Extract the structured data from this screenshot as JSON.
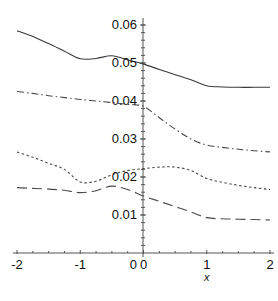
{
  "chart_data": {
    "type": "line",
    "title": "",
    "subtitle": "",
    "xlabel": "x",
    "ylabel": "",
    "xlim": [
      -2,
      2
    ],
    "ylim": [
      0,
      0.064
    ],
    "grid": false,
    "legend": "none",
    "x_ticks": [
      {
        "value": -2,
        "label": "-2"
      },
      {
        "value": -1,
        "label": "-1"
      },
      {
        "value": 0,
        "label": "0"
      },
      {
        "value": 1,
        "label": "1"
      },
      {
        "value": 2,
        "label": "2"
      }
    ],
    "x_minor_ticks": [
      -1.75,
      -1.5,
      -1.25,
      -0.75,
      -0.5,
      -0.25,
      0.25,
      0.5,
      0.75,
      1.25,
      1.5,
      1.75
    ],
    "y_ticks": [
      {
        "value": 0,
        "label": "0"
      },
      {
        "value": 0.01,
        "label": "0.01"
      },
      {
        "value": 0.02,
        "label": "0.02"
      },
      {
        "value": 0.03,
        "label": "0.03"
      },
      {
        "value": 0.04,
        "label": "0.04"
      },
      {
        "value": 0.05,
        "label": "0.05"
      },
      {
        "value": 0.06,
        "label": "0.06"
      }
    ],
    "axis_color": "#555555",
    "series": [
      {
        "name": "solid",
        "style": "solid",
        "color": "#3a3a3a",
        "dasharray": "",
        "x": [
          -2.0,
          -1.75,
          -1.5,
          -1.25,
          -1.0,
          -0.75,
          -0.5,
          -0.25,
          0.0,
          0.25,
          0.5,
          0.75,
          1.0,
          1.25,
          1.5,
          1.75,
          2.0
        ],
        "y": [
          0.0585,
          0.057,
          0.0551,
          0.0531,
          0.0511,
          0.0512,
          0.0519,
          0.0508,
          0.0497,
          0.0483,
          0.0469,
          0.0456,
          0.044,
          0.0437,
          0.0436,
          0.0436,
          0.0436
        ]
      },
      {
        "name": "dash-dot",
        "style": "dashdot",
        "color": "#4a4a4a",
        "dasharray": "7,3,1.5,3",
        "x": [
          -2.0,
          -1.75,
          -1.5,
          -1.25,
          -1.0,
          -0.75,
          -0.5,
          -0.25,
          0.0,
          0.25,
          0.5,
          0.75,
          1.0,
          1.25,
          1.5,
          1.75,
          2.0
        ],
        "y": [
          0.0425,
          0.042,
          0.0414,
          0.0409,
          0.0404,
          0.04,
          0.0396,
          0.0391,
          0.0386,
          0.0356,
          0.0326,
          0.03,
          0.0284,
          0.0278,
          0.0273,
          0.0269,
          0.0266
        ]
      },
      {
        "name": "dotted",
        "style": "dotted",
        "color": "#4a4a4a",
        "dasharray": "2.5,2.5",
        "x": [
          -2.0,
          -1.75,
          -1.5,
          -1.25,
          -1.0,
          -0.75,
          -0.5,
          -0.25,
          0.0,
          0.25,
          0.5,
          0.75,
          1.0,
          1.25,
          1.5,
          1.75,
          2.0
        ],
        "y": [
          0.0266,
          0.0252,
          0.0236,
          0.022,
          0.0187,
          0.0189,
          0.0206,
          0.0217,
          0.0222,
          0.0226,
          0.0226,
          0.0217,
          0.0196,
          0.0186,
          0.0178,
          0.0172,
          0.0167
        ]
      },
      {
        "name": "long-dash",
        "style": "longdash",
        "color": "#4a4a4a",
        "dasharray": "10,5",
        "x": [
          -2.0,
          -1.75,
          -1.5,
          -1.25,
          -1.0,
          -0.75,
          -0.5,
          -0.25,
          0.0,
          0.25,
          0.5,
          0.75,
          1.0,
          1.25,
          1.5,
          1.75,
          2.0
        ],
        "y": [
          0.0172,
          0.017,
          0.0168,
          0.0165,
          0.0159,
          0.0164,
          0.0176,
          0.0167,
          0.015,
          0.0136,
          0.0122,
          0.0108,
          0.0093,
          0.009,
          0.0089,
          0.0088,
          0.0087
        ]
      }
    ]
  }
}
